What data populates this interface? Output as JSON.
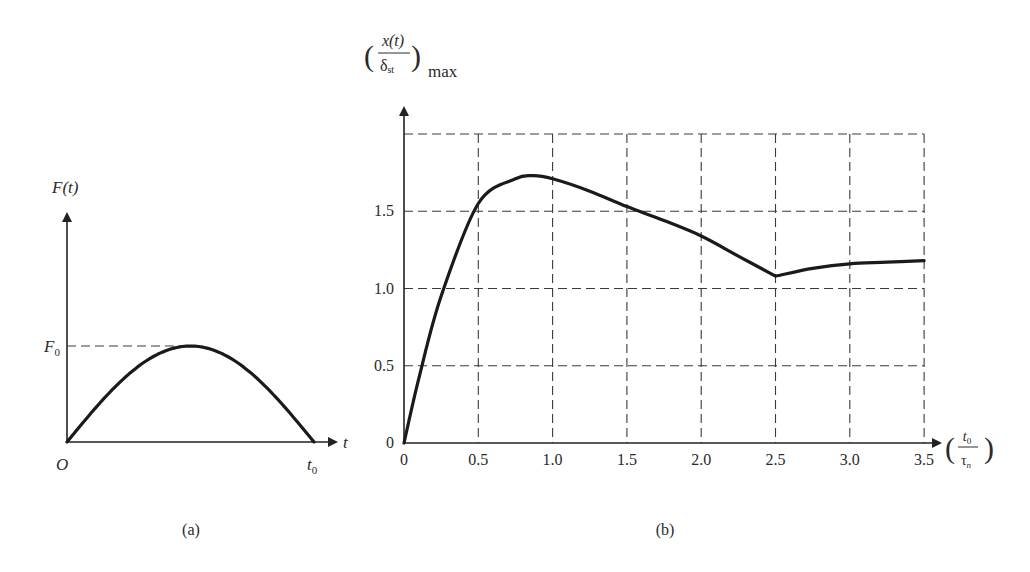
{
  "chart_data": [
    {
      "id": "a",
      "type": "line",
      "caption": "(a)",
      "title": "",
      "xlabel": "t",
      "ylabel": "F(t)",
      "origin_label": "O",
      "x_end_label": "t0",
      "y_level_label": "F0",
      "description": "Half-sine force pulse of amplitude F0 lasting from 0 to t0",
      "x": [
        0,
        0.125,
        0.25,
        0.375,
        0.5,
        0.625,
        0.75,
        0.875,
        1.0
      ],
      "values": [
        0,
        0.383,
        0.707,
        0.924,
        1.0,
        0.924,
        0.707,
        0.383,
        0
      ],
      "grid": false
    },
    {
      "id": "b",
      "type": "line",
      "caption": "(b)",
      "title": "",
      "xlabel": "(t0 / τn)",
      "ylabel": "(x(t) / δst)max",
      "x_ticks": [
        "0",
        "0.5",
        "1.0",
        "1.5",
        "2.0",
        "2.5",
        "3.0",
        "3.5"
      ],
      "y_ticks": [
        "0",
        "0.5",
        "1.0",
        "1.5"
      ],
      "xlim": [
        0,
        3.5
      ],
      "ylim": [
        0,
        2.0
      ],
      "grid": true,
      "x": [
        0,
        0.1,
        0.25,
        0.5,
        0.75,
        0.87,
        1.0,
        1.25,
        1.5,
        1.75,
        2.0,
        2.25,
        2.5,
        2.75,
        3.0,
        3.25,
        3.5
      ],
      "values": [
        0,
        0.42,
        0.95,
        1.55,
        1.71,
        1.73,
        1.71,
        1.63,
        1.53,
        1.44,
        1.34,
        1.21,
        1.08,
        1.13,
        1.16,
        1.17,
        1.18
      ]
    }
  ],
  "labels": {
    "a": {
      "ylabel": "F(t)",
      "f0": "F",
      "f0_sub": "0",
      "origin": "O",
      "t_axis": "t",
      "t0": "t",
      "t0_sub": "0",
      "caption": "(a)"
    },
    "b": {
      "y_num": "x(t)",
      "y_den": "δ",
      "y_den_sub": "st",
      "y_suffix": "max",
      "x_num": "t",
      "x_num_sub": "0",
      "x_den": "τ",
      "x_den_sub": "n",
      "caption": "(b)",
      "x_ticks": [
        "0",
        "0.5",
        "1.0",
        "1.5",
        "2.0",
        "2.5",
        "3.0",
        "3.5"
      ],
      "y_ticks": [
        "0",
        "0.5",
        "1.0",
        "1.5"
      ]
    }
  }
}
